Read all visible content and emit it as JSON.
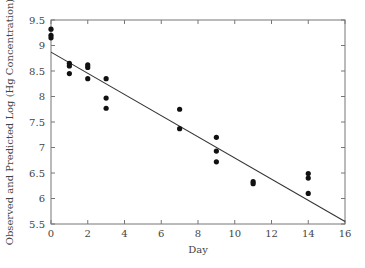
{
  "chart_data": {
    "type": "scatter",
    "title": "",
    "xlabel": "Day",
    "ylabel": "Observed and Predicted Log (Hg Concentration)",
    "xlim": [
      0,
      16
    ],
    "ylim": [
      5.5,
      9.5
    ],
    "xticks": [
      0,
      2,
      4,
      6,
      8,
      10,
      12,
      14,
      16
    ],
    "yticks": [
      5.5,
      6,
      6.5,
      7,
      7.5,
      8,
      8.5,
      9,
      9.5
    ],
    "grid": false,
    "legend": "none",
    "series": [
      {
        "name": "Observed",
        "kind": "scatter",
        "points": [
          [
            0,
            9.32
          ],
          [
            0,
            9.2
          ],
          [
            0,
            9.15
          ],
          [
            1,
            8.65
          ],
          [
            1,
            8.6
          ],
          [
            1,
            8.45
          ],
          [
            2,
            8.62
          ],
          [
            2,
            8.57
          ],
          [
            2,
            8.35
          ],
          [
            3,
            8.35
          ],
          [
            3,
            7.97
          ],
          [
            3,
            7.77
          ],
          [
            7,
            7.75
          ],
          [
            7,
            7.37
          ],
          [
            9,
            7.2
          ],
          [
            9,
            6.93
          ],
          [
            9,
            6.72
          ],
          [
            11,
            6.33
          ],
          [
            11,
            6.29
          ],
          [
            14,
            6.49
          ],
          [
            14,
            6.4
          ],
          [
            14,
            6.1
          ]
        ]
      },
      {
        "name": "Predicted",
        "kind": "line",
        "points": [
          [
            0,
            8.87
          ],
          [
            16,
            5.55
          ]
        ]
      }
    ]
  }
}
